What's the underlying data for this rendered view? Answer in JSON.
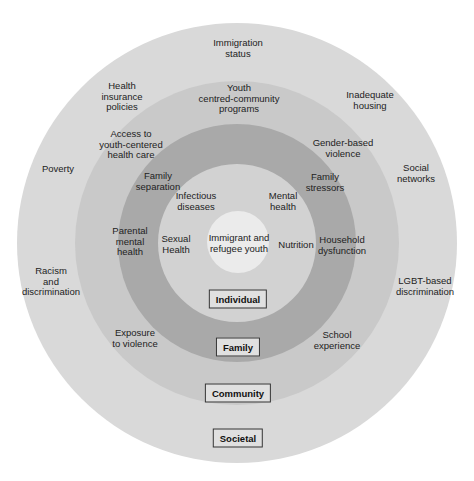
{
  "diagram": {
    "center": {
      "x": 237,
      "y": 243
    },
    "levels": [
      {
        "name": "Societal",
        "radius": 220,
        "color": "#d9d9d9"
      },
      {
        "name": "Community",
        "radius": 162,
        "color": "#c9c9c9"
      },
      {
        "name": "Family",
        "radius": 119,
        "color": "#a9a9a9"
      },
      {
        "name": "Individual",
        "radius": 79,
        "color": "#d2d2d2"
      },
      {
        "name": "Core",
        "radius": 31,
        "color": "#ebebeb"
      }
    ],
    "core_label": "Immigrant and\nrefugee youth",
    "level_boxes": {
      "individual": "Individual",
      "family": "Family",
      "community": "Community",
      "societal": "Societal"
    },
    "individual_factors": {
      "infectious": "Infectious\ndiseases",
      "mental": "Mental\nhealth",
      "sexual": "Sexual\nHealth",
      "nutrition": "Nutrition"
    },
    "family_factors": {
      "separation": "Family\nseparation",
      "stressors": "Family\nstressors",
      "parental": "Parental\nmental\nhealth",
      "household": "Household\ndysfunction"
    },
    "community_factors": {
      "youth_programs": "Youth\ncentred-community\nprograms",
      "access": "Access to\nyouth-centered\nhealth care",
      "gender": "Gender-based\nviolence",
      "exposure": "Exposure\nto violence",
      "school": "School\nexperience"
    },
    "societal_factors": {
      "immigration": "Immigration\nstatus",
      "insurance": "Health\ninsurance\npolicies",
      "housing": "Inadequate\nhousing",
      "poverty": "Poverty",
      "social": "Social\nnetworks",
      "racism": "Racism\nand\ndiscrimination",
      "lgbt": "LGBT-based\ndiscrimination"
    }
  }
}
